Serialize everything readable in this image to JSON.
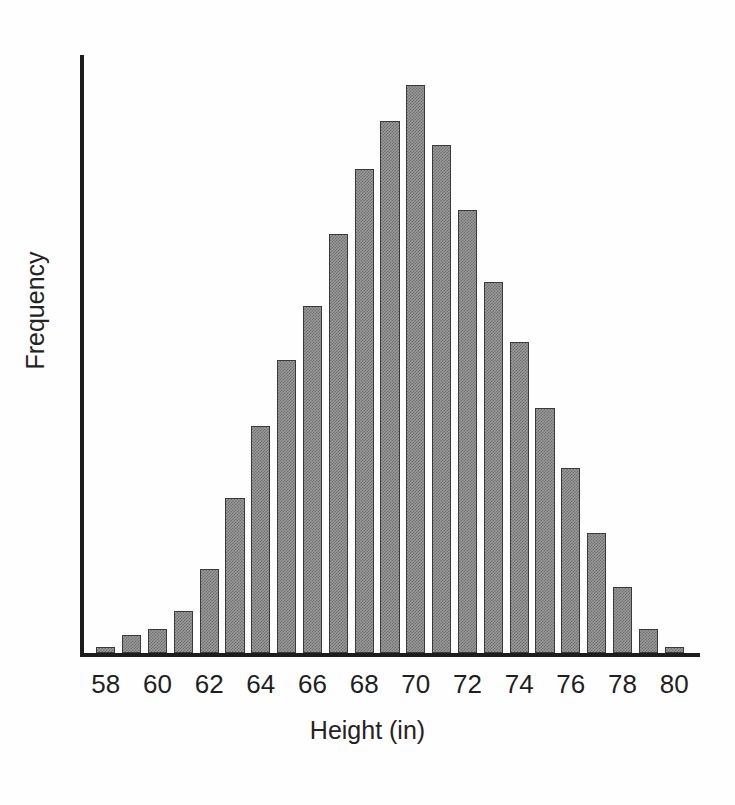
{
  "chart_data": {
    "type": "bar",
    "title": "",
    "subtitle": "",
    "xlabel": "Height (in)",
    "ylabel": "Frequency",
    "grid": false,
    "legend": null,
    "xlim": [
      57,
      81
    ],
    "ylim": [
      0,
      100
    ],
    "xtick_labels": [
      "58",
      "60",
      "62",
      "64",
      "66",
      "68",
      "70",
      "72",
      "74",
      "76",
      "78",
      "80"
    ],
    "xtick_values": [
      58,
      60,
      62,
      64,
      66,
      68,
      70,
      72,
      74,
      76,
      78,
      80
    ],
    "ytick_labels": [],
    "bar_color": "#8f8f8f",
    "bar_edge_color": "#3a3a3a",
    "axis_color": "#1d1d1d",
    "background_color": "#ffffff",
    "categories": [
      58,
      59,
      60,
      61,
      62,
      63,
      64,
      65,
      66,
      67,
      68,
      69,
      70,
      71,
      72,
      73,
      74,
      75,
      76,
      77,
      78,
      79,
      80
    ],
    "values": [
      1,
      3,
      4,
      7,
      14,
      26,
      38,
      49,
      58,
      70,
      81,
      89,
      95,
      85,
      74,
      62,
      52,
      41,
      31,
      20,
      11,
      4,
      1
    ]
  },
  "axes": {
    "ylabel_text": "Frequency",
    "xlabel_text": "Height (in)"
  }
}
